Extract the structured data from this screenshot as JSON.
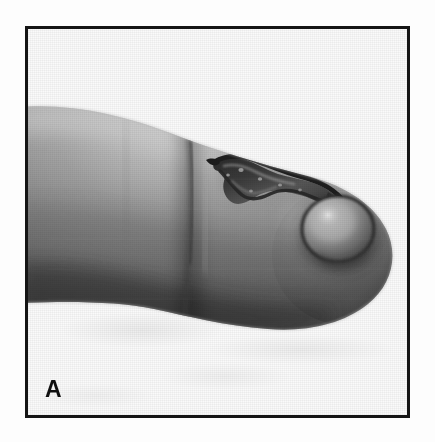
{
  "figure": {
    "panel_label": "A",
    "caption_visible": false,
    "media_type": "clinical-photograph",
    "color_mode": "grayscale"
  },
  "frame": {
    "border_color": "#151515",
    "border_width_px": 3,
    "background_color": "#fbfbfb",
    "left_px": 25,
    "top_px": 26,
    "width_px": 385,
    "height_px": 392
  },
  "photo": {
    "subject": "finger",
    "view": "lateral profile, fingertip pointing right",
    "background_color": "#fafafa",
    "skin": {
      "highlight_tone": "#c9c9c9",
      "midtone": "#9a9a9a",
      "shadow_tone": "#4a4a4a",
      "deep_shadow_tone": "#3a3a3a"
    },
    "features": [
      {
        "name": "knuckle-crease",
        "description": "vertical flexion crease across the mid finger",
        "tone": "#5e5e5e"
      },
      {
        "name": "serpiginous-burrow-track",
        "description": "dark irregular snake-like raised linear tract on the dorsal distal finger",
        "tone": "#2e2e2e"
      },
      {
        "name": "vesicle",
        "description": "rounded dome-shaped fluid-filled blister at the distal end of the tract",
        "rim_tone": "#3b3b3b",
        "dome_tone": "#8d8d8d",
        "highlight_tone": "#d4d4d4"
      },
      {
        "name": "fingertip-pulp",
        "description": "rounded distal fingertip contour",
        "tone": "#6f6f6f"
      }
    ]
  },
  "page": {
    "background_color": "#ffffff",
    "width_px": 435,
    "height_px": 442
  }
}
